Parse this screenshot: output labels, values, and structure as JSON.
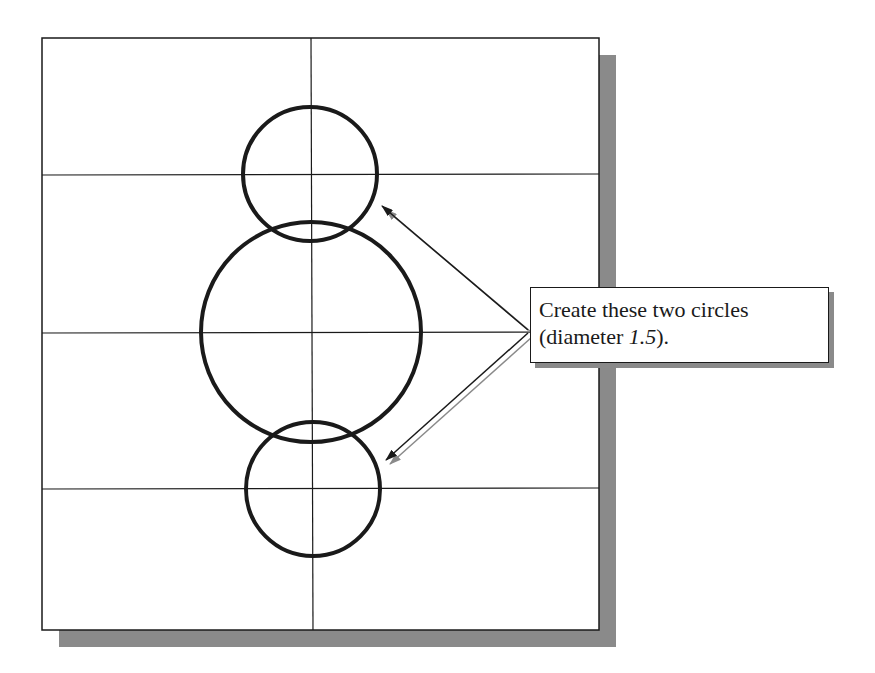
{
  "figure": {
    "type": "cad-drawing-step-illustration",
    "colors": {
      "background": "#ffffff",
      "line": "#1a1a1a",
      "shadow": "#8a8a8a"
    },
    "drawing_area": {
      "x": 42,
      "y": 38,
      "width": 557,
      "height": 592
    },
    "grid": {
      "vertical_lines_x": [
        311
      ],
      "horizontal_lines_y": [
        175,
        333,
        489
      ]
    },
    "circles": [
      {
        "name": "top-circle",
        "cx": 310,
        "cy": 174,
        "r": 67,
        "role": "new"
      },
      {
        "name": "center-circle",
        "cx": 311,
        "cy": 332,
        "r": 110,
        "role": "existing"
      },
      {
        "name": "bottom-circle",
        "cx": 313,
        "cy": 489,
        "r": 67,
        "role": "new"
      }
    ],
    "arrows": [
      {
        "name": "arrow-to-top-circle",
        "from": [
          528,
          330
        ],
        "to": [
          382,
          206
        ]
      },
      {
        "name": "arrow-to-bottom-circle",
        "from": [
          528,
          333
        ],
        "to": [
          386,
          460
        ]
      }
    ]
  },
  "callout": {
    "line1": "Create these two circles",
    "line2_prefix": "(diameter ",
    "line2_value": "1.5",
    "line2_suffix": ")."
  }
}
